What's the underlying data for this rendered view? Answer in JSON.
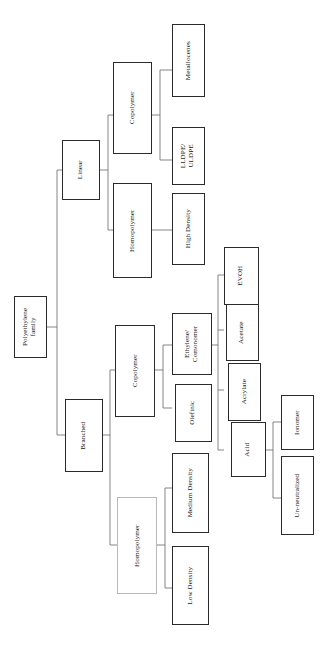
{
  "diagram": {
    "title": "Polyethylene family",
    "orientation": "rotated-90-ccw",
    "nodes": {
      "root": "Polyethylene\nfamily",
      "linear": "Linear",
      "branched": "Branched",
      "linear_copolymer": "Copolymer",
      "linear_homopolymer": "Homopolymer",
      "metallocenes": "Metallocenes",
      "lldpe_uldpe": "LLDPE/\nULDPE",
      "high_density": "High Density",
      "branched_copolymer": "Copolymer",
      "branched_homopolymer": "Homopolymer",
      "ethylene_comonomer": "Ethylene/\nComonomer",
      "olefinic": "Olefinic",
      "medium_density": "Medium Density",
      "low_density": "Low Density",
      "evoh": "EVOH",
      "acetate": "Acetate",
      "acrylate": "Acrylate",
      "acid": "Acid",
      "ionomer": "Ionomer",
      "un_neutralized": "Un-neutralized"
    },
    "colors": {
      "box_border": "#2b2b2b",
      "box_border_soft": "#b9b9b9",
      "connector": "#6f6f6f",
      "text": "#1a1a1a",
      "background": "#ffffff"
    }
  }
}
